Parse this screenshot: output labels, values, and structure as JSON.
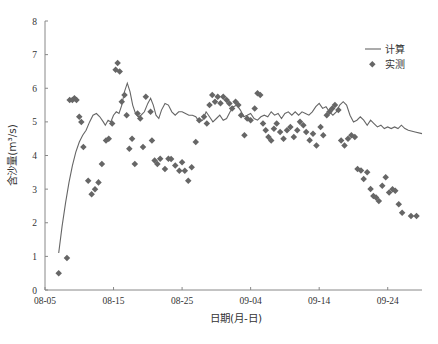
{
  "chart_data": {
    "type": "line+scatter",
    "title": "",
    "xlabel": "日期(月-日)",
    "ylabel": "含沙量(m³/s)",
    "ylim": [
      0,
      8
    ],
    "xlim_days_from_0805": [
      0,
      55
    ],
    "x_tick_labels": [
      "08-05",
      "08-15",
      "08-25",
      "09-04",
      "09-14",
      "09-24"
    ],
    "x_tick_days": [
      0,
      10,
      20,
      30,
      40,
      50
    ],
    "y_ticks": [
      0,
      1,
      2,
      3,
      4,
      5,
      6,
      7,
      8
    ],
    "grid": false,
    "legend_position": "upper right",
    "legend": [
      {
        "label": "计算",
        "marker": "line"
      },
      {
        "label": "实测",
        "marker": "diamond"
      }
    ],
    "series": [
      {
        "name": "计算",
        "kind": "line",
        "points": [
          [
            2.0,
            1.1
          ],
          [
            2.5,
            1.9
          ],
          [
            3.0,
            2.6
          ],
          [
            3.5,
            3.2
          ],
          [
            4.0,
            3.7
          ],
          [
            4.5,
            4.1
          ],
          [
            5.0,
            4.4
          ],
          [
            5.5,
            4.6
          ],
          [
            6.0,
            4.75
          ],
          [
            6.5,
            5.0
          ],
          [
            7.0,
            5.2
          ],
          [
            7.5,
            5.25
          ],
          [
            8.0,
            5.15
          ],
          [
            8.5,
            5.0
          ],
          [
            8.8,
            4.9
          ],
          [
            9.2,
            5.05
          ],
          [
            9.6,
            5.0
          ],
          [
            10.0,
            5.2
          ],
          [
            10.4,
            5.3
          ],
          [
            10.8,
            5.25
          ],
          [
            11.2,
            5.5
          ],
          [
            11.6,
            5.9
          ],
          [
            12.0,
            6.15
          ],
          [
            12.4,
            5.9
          ],
          [
            12.8,
            5.5
          ],
          [
            13.2,
            5.25
          ],
          [
            13.6,
            5.15
          ],
          [
            14.0,
            5.2
          ],
          [
            14.5,
            5.3
          ],
          [
            15.0,
            5.55
          ],
          [
            15.4,
            5.7
          ],
          [
            15.8,
            5.5
          ],
          [
            16.2,
            5.2
          ],
          [
            16.6,
            5.1
          ],
          [
            17.0,
            5.35
          ],
          [
            17.5,
            5.55
          ],
          [
            18.0,
            5.5
          ],
          [
            18.5,
            5.3
          ],
          [
            19.0,
            5.2
          ],
          [
            19.5,
            5.3
          ],
          [
            20.0,
            5.3
          ],
          [
            20.5,
            5.25
          ],
          [
            21.0,
            5.2
          ],
          [
            21.5,
            5.2
          ],
          [
            22.0,
            5.15
          ],
          [
            22.5,
            5.0
          ],
          [
            23.0,
            5.05
          ],
          [
            23.5,
            5.3
          ],
          [
            24.0,
            5.15
          ],
          [
            24.5,
            5.0
          ],
          [
            25.0,
            5.1
          ],
          [
            25.5,
            5.2
          ],
          [
            26.0,
            5.05
          ],
          [
            26.5,
            5.1
          ],
          [
            27.0,
            5.3
          ],
          [
            27.5,
            5.45
          ],
          [
            28.0,
            5.5
          ],
          [
            28.5,
            5.35
          ],
          [
            29.0,
            5.15
          ],
          [
            29.5,
            5.2
          ],
          [
            30.0,
            5.25
          ],
          [
            30.5,
            5.1
          ],
          [
            31.0,
            5.05
          ],
          [
            31.5,
            5.15
          ],
          [
            32.0,
            5.2
          ],
          [
            32.5,
            5.15
          ],
          [
            33.0,
            5.3
          ],
          [
            33.5,
            5.2
          ],
          [
            34.0,
            5.25
          ],
          [
            34.5,
            5.1
          ],
          [
            35.0,
            5.25
          ],
          [
            35.5,
            5.3
          ],
          [
            36.0,
            5.2
          ],
          [
            36.5,
            5.3
          ],
          [
            37.0,
            5.2
          ],
          [
            37.5,
            5.3
          ],
          [
            38.0,
            5.25
          ],
          [
            38.5,
            5.2
          ],
          [
            39.0,
            5.3
          ],
          [
            39.5,
            5.45
          ],
          [
            40.0,
            5.55
          ],
          [
            40.5,
            5.4
          ],
          [
            41.0,
            5.45
          ],
          [
            41.5,
            5.3
          ],
          [
            42.0,
            5.2
          ],
          [
            42.5,
            5.3
          ],
          [
            43.0,
            5.5
          ],
          [
            43.5,
            5.6
          ],
          [
            44.0,
            5.5
          ],
          [
            44.5,
            5.2
          ],
          [
            45.0,
            5.0
          ],
          [
            45.5,
            5.05
          ],
          [
            46.0,
            5.15
          ],
          [
            46.5,
            5.05
          ],
          [
            47.0,
            4.9
          ],
          [
            47.5,
            5.05
          ],
          [
            48.0,
            4.95
          ],
          [
            48.5,
            4.85
          ],
          [
            49.0,
            4.9
          ],
          [
            49.5,
            4.8
          ],
          [
            50.0,
            4.85
          ],
          [
            50.5,
            4.8
          ],
          [
            51.0,
            4.85
          ],
          [
            51.5,
            4.8
          ],
          [
            52.0,
            4.9
          ],
          [
            52.5,
            4.8
          ],
          [
            53.0,
            4.75
          ],
          [
            54.0,
            4.7
          ],
          [
            55.0,
            4.65
          ]
        ]
      },
      {
        "name": "实测",
        "kind": "scatter",
        "marker": "diamond",
        "points": [
          [
            2.0,
            0.5
          ],
          [
            3.2,
            0.95
          ],
          [
            3.6,
            5.65
          ],
          [
            4.0,
            5.65
          ],
          [
            4.3,
            5.7
          ],
          [
            4.6,
            5.65
          ],
          [
            5.0,
            5.15
          ],
          [
            5.3,
            5.0
          ],
          [
            5.6,
            4.25
          ],
          [
            6.3,
            3.25
          ],
          [
            6.8,
            2.85
          ],
          [
            7.3,
            3.0
          ],
          [
            7.8,
            3.2
          ],
          [
            8.3,
            3.75
          ],
          [
            8.9,
            4.45
          ],
          [
            9.3,
            4.5
          ],
          [
            9.8,
            4.95
          ],
          [
            10.3,
            6.55
          ],
          [
            10.6,
            6.75
          ],
          [
            10.9,
            6.5
          ],
          [
            11.2,
            5.6
          ],
          [
            11.6,
            5.8
          ],
          [
            11.9,
            5.2
          ],
          [
            12.3,
            4.2
          ],
          [
            12.7,
            4.5
          ],
          [
            13.1,
            3.75
          ],
          [
            13.5,
            5.25
          ],
          [
            13.9,
            5.1
          ],
          [
            14.3,
            4.25
          ],
          [
            14.7,
            5.75
          ],
          [
            15.4,
            5.3
          ],
          [
            15.6,
            4.45
          ],
          [
            16.0,
            3.85
          ],
          [
            16.4,
            3.75
          ],
          [
            16.8,
            3.9
          ],
          [
            17.5,
            3.6
          ],
          [
            18.0,
            3.9
          ],
          [
            18.4,
            3.9
          ],
          [
            19.0,
            3.7
          ],
          [
            19.6,
            3.55
          ],
          [
            20.0,
            3.8
          ],
          [
            20.4,
            3.55
          ],
          [
            20.9,
            3.25
          ],
          [
            21.4,
            3.65
          ],
          [
            22.0,
            4.4
          ],
          [
            22.5,
            5.05
          ],
          [
            23.2,
            5.15
          ],
          [
            23.6,
            4.95
          ],
          [
            24.0,
            5.5
          ],
          [
            24.4,
            5.8
          ],
          [
            24.8,
            5.6
          ],
          [
            25.2,
            5.75
          ],
          [
            25.6,
            5.55
          ],
          [
            26.0,
            5.75
          ],
          [
            26.5,
            5.65
          ],
          [
            26.9,
            5.55
          ],
          [
            27.3,
            5.4
          ],
          [
            27.8,
            5.6
          ],
          [
            28.2,
            5.5
          ],
          [
            28.6,
            5.2
          ],
          [
            29.1,
            4.6
          ],
          [
            29.5,
            5.1
          ],
          [
            30.0,
            5.05
          ],
          [
            30.6,
            5.4
          ],
          [
            31.0,
            5.85
          ],
          [
            31.4,
            5.8
          ],
          [
            31.8,
            4.95
          ],
          [
            32.2,
            4.75
          ],
          [
            32.6,
            4.55
          ],
          [
            33.0,
            4.45
          ],
          [
            33.4,
            4.8
          ],
          [
            33.8,
            4.95
          ],
          [
            34.3,
            4.7
          ],
          [
            34.8,
            4.5
          ],
          [
            35.3,
            4.75
          ],
          [
            35.8,
            4.85
          ],
          [
            36.3,
            4.55
          ],
          [
            36.8,
            4.75
          ],
          [
            37.2,
            5.0
          ],
          [
            37.7,
            4.9
          ],
          [
            38.1,
            4.7
          ],
          [
            38.6,
            4.45
          ],
          [
            39.1,
            4.65
          ],
          [
            39.6,
            4.3
          ],
          [
            40.2,
            4.85
          ],
          [
            40.6,
            4.6
          ],
          [
            41.1,
            5.2
          ],
          [
            41.5,
            5.3
          ],
          [
            41.9,
            5.4
          ],
          [
            42.3,
            5.5
          ],
          [
            42.8,
            5.35
          ],
          [
            43.2,
            4.45
          ],
          [
            43.7,
            4.3
          ],
          [
            44.2,
            4.5
          ],
          [
            44.7,
            4.6
          ],
          [
            45.2,
            4.55
          ],
          [
            45.6,
            3.6
          ],
          [
            46.1,
            3.55
          ],
          [
            46.5,
            3.3
          ],
          [
            47.0,
            3.5
          ],
          [
            47.5,
            3.0
          ],
          [
            47.9,
            2.8
          ],
          [
            48.3,
            2.75
          ],
          [
            48.7,
            2.65
          ],
          [
            49.2,
            3.1
          ],
          [
            49.7,
            3.35
          ],
          [
            50.2,
            2.9
          ],
          [
            50.7,
            3.0
          ],
          [
            51.1,
            2.95
          ],
          [
            51.6,
            2.55
          ],
          [
            52.1,
            2.3
          ],
          [
            53.4,
            2.2
          ],
          [
            54.2,
            2.2
          ]
        ]
      }
    ]
  },
  "colors": {
    "line": "#666666",
    "marker": "#666666",
    "axis": "#888888",
    "text": "#333333",
    "background": "#ffffff"
  }
}
